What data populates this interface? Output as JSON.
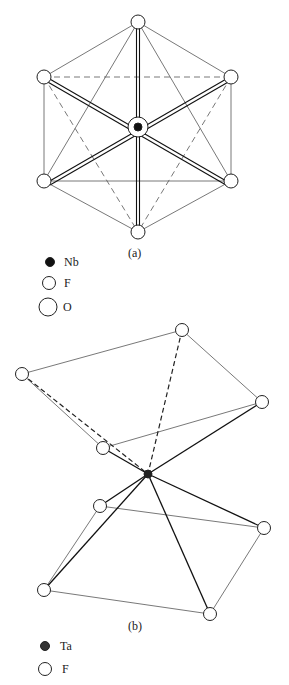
{
  "figure_a": {
    "caption": "(a)",
    "center_atom": "Nb",
    "legend": [
      {
        "symbol": "filled-circle-small",
        "label": "Nb"
      },
      {
        "symbol": "open-circle-medium",
        "label": "F"
      },
      {
        "symbol": "open-circle-large",
        "label": "O"
      }
    ]
  },
  "figure_b": {
    "caption": "(b)",
    "center_atom": "Ta",
    "legend": [
      {
        "symbol": "dark-circle-small",
        "label": "Ta"
      },
      {
        "symbol": "open-circle-medium",
        "label": "F"
      }
    ]
  },
  "colors": {
    "line": "#444444",
    "bond": "#111111",
    "background": "#ffffff"
  }
}
